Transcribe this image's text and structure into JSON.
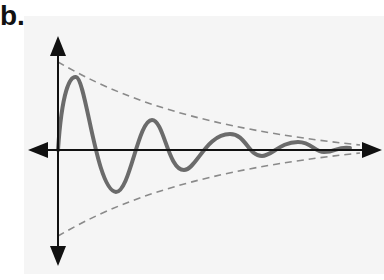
{
  "figure": {
    "label": "b.",
    "colors": {
      "curve": "#6b6b6b",
      "envelope": "#8a8a8a",
      "axes": "#111111",
      "background": "#f5f5f5"
    }
  }
}
